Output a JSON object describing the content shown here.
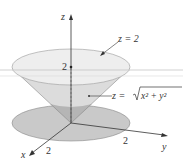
{
  "figure": {
    "axes": {
      "z_label": "z",
      "x_label": "x",
      "y_label": "y"
    },
    "ticks": {
      "z_tick": "2",
      "x_tick": "2",
      "y_tick": "2"
    },
    "annotations": {
      "plane_label": "z = 2",
      "cone_label_prefix": "z = ",
      "cone_label_radicand": "x² + y²"
    },
    "colors": {
      "top_disk": "#ececec",
      "cone_side": "#d9d9d9",
      "cone_inner_dark": "#b8b8b8",
      "base_disk": "#c8c8c8",
      "axis": "#333333",
      "horizon_line": "#bcbcbc"
    }
  }
}
